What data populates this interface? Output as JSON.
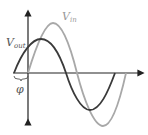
{
  "diagram": {
    "type": "phase-shift-sine-waves",
    "labels": {
      "vin_main": "V",
      "vin_sub": "in",
      "vout_main": "V",
      "vout_sub": "out",
      "phase": "φ"
    },
    "colors": {
      "vout": "#3a3a3a",
      "vin": "#a8a8a8",
      "axis": "#222222",
      "background": "#ffffff"
    },
    "series": [
      {
        "name": "V_out",
        "color": "#3a3a3a",
        "x_start": 14,
        "x_end": 115,
        "amplitude_px": 35
      },
      {
        "name": "V_in",
        "color": "#a8a8a8",
        "x_start": 28,
        "x_end": 126,
        "amplitude_px": 50
      }
    ],
    "axes": {
      "x_axis_y": 73,
      "y_axis_x": 28
    }
  }
}
